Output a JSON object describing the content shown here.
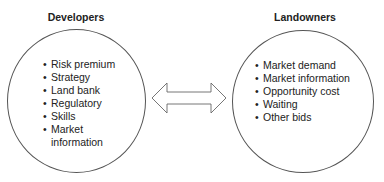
{
  "left": {
    "title": "Developers",
    "items": [
      "Risk premium",
      "Strategy",
      "Land bank",
      "Regulatory",
      "Skills",
      "Market",
      "information"
    ]
  },
  "right": {
    "title": "Landowners",
    "items": [
      "Market demand",
      "Market information",
      "Opportunity cost",
      "Waiting",
      "Other bids"
    ]
  },
  "connector": {
    "icon": "double-headed-arrow-icon"
  },
  "bullet": "•"
}
